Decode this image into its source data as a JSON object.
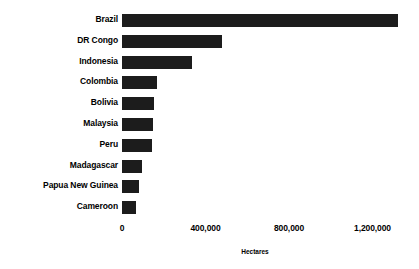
{
  "chart_data": {
    "type": "bar",
    "orientation": "horizontal",
    "title": "",
    "xlabel": "Hectares",
    "ylabel": "",
    "grid": false,
    "legend": false,
    "xlim": [
      0,
      1400000
    ],
    "x_ticks": [
      "0",
      "400,000",
      "800,000",
      "1,200,000"
    ],
    "x_tick_values": [
      0,
      400000,
      800000,
      1200000
    ],
    "categories": [
      "Brazil",
      "DR Congo",
      "Indonesia",
      "Colombia",
      "Bolivia",
      "Malaysia",
      "Peru",
      "Madagascar",
      "Papua New Guinea",
      "Cameroon"
    ],
    "values": [
      1320000,
      480000,
      335000,
      170000,
      155000,
      148000,
      145000,
      95000,
      80000,
      65000
    ],
    "bar_color": "#1c1c1c"
  }
}
